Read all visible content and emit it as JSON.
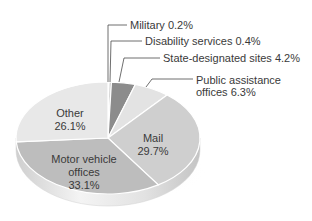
{
  "chart_data": {
    "type": "pie",
    "title": "",
    "style": "3d-pie",
    "categories": [
      "Military",
      "Disability services",
      "State-designated sites",
      "Public assistance offices",
      "Mail",
      "Motor vehicle offices",
      "Other"
    ],
    "values": [
      0.2,
      0.4,
      4.2,
      6.3,
      29.7,
      33.1,
      26.1
    ],
    "unit": "%",
    "labels": {
      "military": "Military  0.2%",
      "disability": "Disability services  0.4%",
      "state": "State-designated sites  4.2%",
      "public_line1": "Public assistance",
      "public_line2": "offices  6.3%",
      "mail_name": "Mail",
      "mail_value": "29.7%",
      "motor_line1": "Motor vehicle",
      "motor_line2": "offices",
      "motor_value": "33.1%",
      "other_name": "Other",
      "other_value": "26.1%"
    },
    "colors": {
      "military": "#9a9a9a",
      "disability": "#b5b5b5",
      "state": "#8c8c8c",
      "public": "#e3e3e3",
      "mail": "#cfcfcf",
      "motor": "#bdbdbd",
      "other": "#e8e8e8",
      "edge": "#d8d8d8",
      "leader": "#4a4a4a"
    }
  }
}
